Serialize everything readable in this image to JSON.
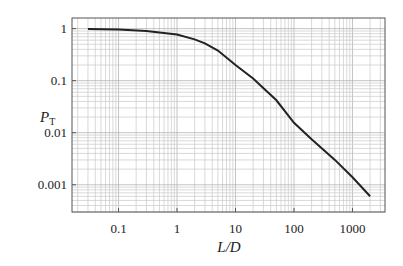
{
  "chart_data": {
    "type": "line",
    "title": "",
    "xlabel": "L/D",
    "ylabel": "P_T",
    "ylabel_main": "P",
    "ylabel_sub": "T",
    "xscale": "log",
    "yscale": "log",
    "xlim": [
      0.016,
      3600
    ],
    "ylim": [
      0.0003,
      1.6
    ],
    "grid": true,
    "legend": null,
    "x_ticks": [
      0.1,
      1,
      10,
      100,
      1000
    ],
    "x_tick_labels": [
      "0.1",
      "1",
      "10",
      "100",
      "1000"
    ],
    "y_ticks": [
      1,
      0.1,
      0.01,
      0.001
    ],
    "y_tick_labels": [
      "1",
      "0.1",
      "0.01",
      "0.001"
    ],
    "series": [
      {
        "name": "P_T",
        "x": [
          0.03,
          0.1,
          0.3,
          1,
          2,
          3,
          5,
          10,
          20,
          50,
          100,
          200,
          500,
          1000,
          2000
        ],
        "y": [
          0.99,
          0.96,
          0.9,
          0.77,
          0.62,
          0.52,
          0.38,
          0.2,
          0.11,
          0.042,
          0.0155,
          0.0075,
          0.003,
          0.0014,
          0.0006
        ]
      }
    ],
    "colors": {
      "line": "#222222",
      "grid": "#c8c8c8",
      "frame": "#555555",
      "text": "#222222"
    }
  }
}
